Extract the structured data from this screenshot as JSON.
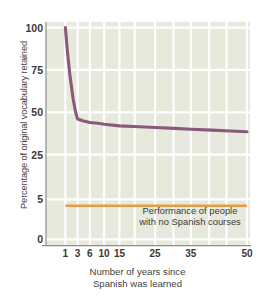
{
  "chart_data": {
    "type": "line",
    "title": "",
    "xlabel": "Number of years since Spanish was learned",
    "xlabel_lines": [
      "Number of years since",
      "Spanish was learned"
    ],
    "ylabel": "Percentage of original vocabulary retained",
    "x_ticks": [
      "1",
      "3",
      "6",
      "10",
      "15",
      "25",
      "35",
      "50"
    ],
    "x_tick_values": [
      1,
      3,
      6,
      10,
      15,
      25,
      35,
      50
    ],
    "y_ticks": [
      "100",
      "75",
      "50",
      "25",
      "5",
      "0"
    ],
    "y_tick_values": [
      100,
      75,
      50,
      25,
      5,
      0
    ],
    "ylim": [
      0,
      100
    ],
    "grid": true,
    "grid_color": "#ffffff",
    "plot_background": "#e7e9dd",
    "legend": "none",
    "series": [
      {
        "name": "Percentage of original vocabulary retained",
        "color": "#8b5a7a",
        "x": [
          1,
          1.2,
          1.5,
          2,
          2.5,
          3,
          4,
          6,
          8,
          10,
          15,
          20,
          25,
          30,
          35,
          40,
          45,
          50
        ],
        "values": [
          100,
          86,
          72,
          58,
          50,
          46,
          45,
          44,
          43.5,
          43,
          42,
          41.5,
          41,
          40.5,
          40,
          39.5,
          39,
          38.5
        ]
      },
      {
        "name": "Performance of people with no Spanish courses",
        "color": "#e89a4a",
        "x": [
          1,
          50
        ],
        "values": [
          4.2,
          4.2
        ],
        "style": "reference-line"
      }
    ],
    "annotations": [
      {
        "text": "Performance of people with no Spanish courses",
        "lines": [
          "Performance of people",
          "with no Spanish courses"
        ],
        "x": 18,
        "y": 12
      }
    ]
  },
  "colors": {
    "curve": "#8b5a7a",
    "baseline": "#e89a4a",
    "plot_background": "#e7e9dd",
    "gridline": "#ffffff",
    "axis": "#8e8e86",
    "text": "#3a3a38"
  }
}
